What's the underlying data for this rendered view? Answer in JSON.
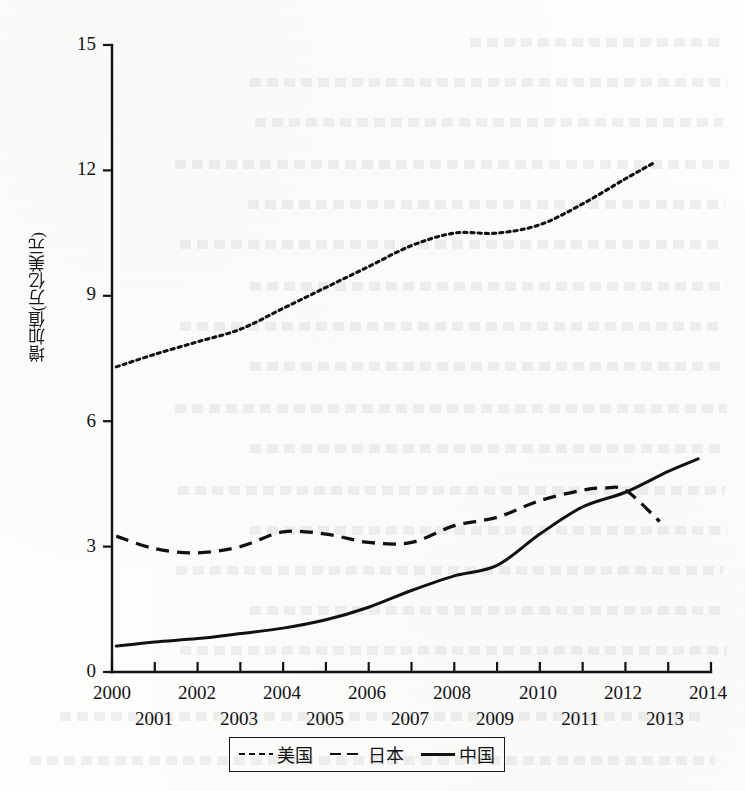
{
  "figure": {
    "y_axis_label": "增加值(万亿美元)",
    "y_ticks": [
      "0",
      "3",
      "6",
      "9",
      "12",
      "15"
    ],
    "x_ticks_top_row": [
      "2000",
      "2002",
      "2004",
      "2006",
      "2008",
      "2010",
      "2012",
      "2014"
    ],
    "x_ticks_bottom_row": [
      "2001",
      "2003",
      "2005",
      "2007",
      "2009",
      "2011",
      "2013"
    ]
  },
  "legend": {
    "items": [
      {
        "label": "美国",
        "style": "dotted"
      },
      {
        "label": "日本",
        "style": "dashed"
      },
      {
        "label": "中国",
        "style": "solid"
      }
    ]
  },
  "chart_data": {
    "type": "line",
    "title": "",
    "xlabel": "",
    "ylabel": "增加值(万亿美元)",
    "xlim": [
      2000,
      2014
    ],
    "ylim": [
      0,
      15
    ],
    "yticks": [
      0,
      3,
      6,
      9,
      12,
      15
    ],
    "xticks": [
      2000,
      2001,
      2002,
      2003,
      2004,
      2005,
      2006,
      2007,
      2008,
      2009,
      2010,
      2011,
      2012,
      2013,
      2014
    ],
    "grid": false,
    "legend_position": "bottom",
    "x": [
      2000,
      2001,
      2002,
      2003,
      2004,
      2005,
      2006,
      2007,
      2008,
      2009,
      2010,
      2011,
      2012,
      2013,
      2014
    ],
    "series": [
      {
        "name": "美国",
        "line_style": "dotted",
        "x": [
          2000.1,
          2001,
          2002,
          2003,
          2004,
          2005,
          2006,
          2007,
          2008,
          2009,
          2010,
          2011,
          2012,
          2012.7
        ],
        "values": [
          7.3,
          7.6,
          7.9,
          8.2,
          8.7,
          9.2,
          9.7,
          10.2,
          10.5,
          10.5,
          10.7,
          11.2,
          11.8,
          12.2
        ]
      },
      {
        "name": "日本",
        "line_style": "dashed",
        "x": [
          2000.1,
          2001,
          2002,
          2003,
          2004,
          2005,
          2006,
          2007,
          2008,
          2009,
          2010,
          2011,
          2011.5,
          2012,
          2012.8
        ],
        "values": [
          3.25,
          2.95,
          2.85,
          3.0,
          3.35,
          3.3,
          3.1,
          3.1,
          3.5,
          3.7,
          4.1,
          4.35,
          4.4,
          4.35,
          3.6
        ]
      },
      {
        "name": "中国",
        "line_style": "solid",
        "x": [
          2000.1,
          2001,
          2002,
          2003,
          2004,
          2005,
          2006,
          2007,
          2008,
          2009,
          2010,
          2011,
          2012,
          2013,
          2013.7
        ],
        "values": [
          0.62,
          0.72,
          0.8,
          0.92,
          1.05,
          1.25,
          1.55,
          1.95,
          2.3,
          2.55,
          3.3,
          3.95,
          4.3,
          4.8,
          5.1
        ]
      }
    ]
  }
}
